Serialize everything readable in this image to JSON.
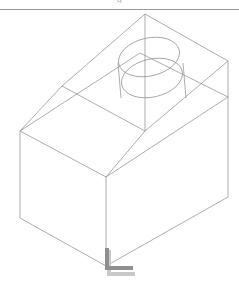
{
  "page": {
    "background_color": "#ffffff",
    "width": 239,
    "height": 283
  },
  "header": {
    "clipped_text": "g",
    "rule_color": "#9a9a9a",
    "rule_y": 9
  },
  "viewport": {
    "name": "cad-wireframe-viewport",
    "projection": "isometric",
    "line_color": "#8a8a8a",
    "line_width": 0.7,
    "ucs_marker_color": "#8f8f8f",
    "ucs_marker_shadow_color": "#c9c9c9"
  },
  "geometry": {
    "box": {
      "label": "rectangular-box-solid",
      "vertices": {
        "left_top": [
          20,
          131
        ],
        "left_bottom": [
          20,
          218
        ],
        "front_top": [
          106,
          177
        ],
        "front_bottom": [
          106,
          266
        ],
        "right_top": [
          228,
          97
        ],
        "right_bottom": [
          228,
          197
        ],
        "back_top": [
          140,
          53
        ],
        "top_far": [
          143,
          119
        ]
      },
      "top_face": [
        [
          20,
          131
        ],
        [
          106,
          177
        ],
        [
          228,
          97
        ],
        [
          140,
          53
        ]
      ],
      "left_face": [
        [
          20,
          131
        ],
        [
          20,
          218
        ],
        [
          106,
          266
        ],
        [
          106,
          177
        ]
      ],
      "right_face": [
        [
          106,
          177
        ],
        [
          106,
          266
        ],
        [
          228,
          197
        ],
        [
          228,
          97
        ]
      ]
    },
    "roof": {
      "label": "pyramidal-roof",
      "apex": [
        145,
        14
      ],
      "base": [
        [
          62,
          86
        ],
        [
          145,
          131
        ],
        [
          228,
          61
        ],
        [
          145,
          14
        ]
      ],
      "ridge_lines": [
        [
          [
            145,
            14
          ],
          [
            62,
            86
          ]
        ],
        [
          [
            145,
            14
          ],
          [
            228,
            61
          ]
        ],
        [
          [
            62,
            86
          ],
          [
            145,
            131
          ]
        ],
        [
          [
            145,
            131
          ],
          [
            228,
            61
          ]
        ]
      ]
    },
    "cylinder": {
      "label": "cylinder-through-roof",
      "top_ellipse": {
        "center": [
          149,
          57
        ],
        "rx": 31,
        "ry": 19,
        "rotation_deg": -13
      },
      "bottom_ellipse": {
        "center": [
          152,
          78
        ],
        "rx": 31,
        "ry": 19,
        "rotation_deg": -13
      },
      "silhouette_left_x": 118,
      "silhouette_right_x": 183
    },
    "axis_line": {
      "label": "vertical-construction-axis",
      "from": [
        145,
        14
      ],
      "to": [
        145,
        131
      ]
    },
    "ucs_marker": {
      "label": "ucs-origin-marker",
      "origin": [
        105,
        270
      ],
      "y_arm_length": 22,
      "x_arm_length": 28,
      "bar_thickness": 4
    }
  }
}
